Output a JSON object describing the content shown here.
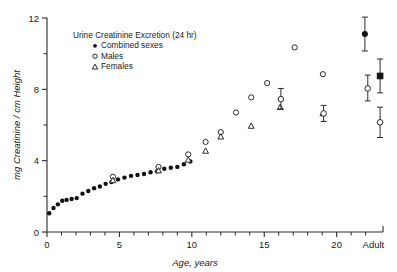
{
  "figure": {
    "legend_title": "Urine  Creatinine  Excretion   (24 hr)",
    "legend_items": [
      {
        "label": "Combined  sexes",
        "marker": "filled-circle"
      },
      {
        "label": "Males",
        "marker": "open-circle"
      },
      {
        "label": "Females",
        "marker": "open-triangle"
      }
    ]
  },
  "chart_data": {
    "type": "scatter",
    "title": "Urine  Creatinine  Excretion   (24 hr)",
    "xlabel": "Age,  years",
    "ylabel": "mg Creatinine / cm Height",
    "xlim": [
      0,
      23.2
    ],
    "ylim": [
      0,
      12
    ],
    "grid": false,
    "legend_position": "top-left-inside",
    "x_ticks_major": [
      0,
      5,
      10,
      15,
      20
    ],
    "x_tick_labels": [
      "0",
      "5",
      "10",
      "15",
      "20",
      "Adult"
    ],
    "x_adult_label": "Adult",
    "x_adult_value": 22.4,
    "y_ticks_major": [
      0,
      4,
      8,
      12
    ],
    "y_tick_labels": [
      "0",
      "4",
      "8",
      "12"
    ],
    "y_ticks_minor": [
      2,
      6,
      10
    ],
    "series": [
      {
        "name": "Combined sexes",
        "marker": "filled-circle",
        "points": [
          {
            "x": 0.15,
            "y": 1.05
          },
          {
            "x": 0.45,
            "y": 1.35
          },
          {
            "x": 0.75,
            "y": 1.55
          },
          {
            "x": 1.05,
            "y": 1.75
          },
          {
            "x": 1.35,
            "y": 1.8
          },
          {
            "x": 1.7,
            "y": 1.85
          },
          {
            "x": 2.05,
            "y": 1.9
          },
          {
            "x": 2.45,
            "y": 2.15
          },
          {
            "x": 2.85,
            "y": 2.3
          },
          {
            "x": 3.25,
            "y": 2.45
          },
          {
            "x": 3.65,
            "y": 2.55
          },
          {
            "x": 4.05,
            "y": 2.7
          },
          {
            "x": 4.45,
            "y": 2.8
          },
          {
            "x": 4.9,
            "y": 2.95
          },
          {
            "x": 5.35,
            "y": 3.05
          },
          {
            "x": 5.8,
            "y": 3.15
          },
          {
            "x": 6.25,
            "y": 3.2
          },
          {
            "x": 6.7,
            "y": 3.25
          },
          {
            "x": 7.15,
            "y": 3.35
          },
          {
            "x": 7.6,
            "y": 3.4
          },
          {
            "x": 8.1,
            "y": 3.55
          },
          {
            "x": 8.55,
            "y": 3.6
          },
          {
            "x": 9.0,
            "y": 3.65
          },
          {
            "x": 9.45,
            "y": 3.8
          },
          {
            "x": 9.9,
            "y": 3.95
          }
        ]
      },
      {
        "name": "Males",
        "marker": "open-circle",
        "points": [
          {
            "x": 4.55,
            "y": 3.1
          },
          {
            "x": 7.7,
            "y": 3.65
          },
          {
            "x": 9.75,
            "y": 4.35
          },
          {
            "x": 10.95,
            "y": 5.05
          },
          {
            "x": 12.0,
            "y": 5.6
          },
          {
            "x": 13.05,
            "y": 6.7
          },
          {
            "x": 14.1,
            "y": 7.55
          },
          {
            "x": 15.2,
            "y": 8.35
          },
          {
            "x": 17.1,
            "y": 10.35
          },
          {
            "x": 19.05,
            "y": 8.85
          }
        ]
      },
      {
        "name": "Females",
        "marker": "open-triangle",
        "points": [
          {
            "x": 4.55,
            "y": 2.9
          },
          {
            "x": 7.7,
            "y": 3.45
          },
          {
            "x": 9.75,
            "y": 4.05
          },
          {
            "x": 10.95,
            "y": 4.55
          },
          {
            "x": 12.0,
            "y": 5.35
          },
          {
            "x": 14.1,
            "y": 5.95
          },
          {
            "x": 16.1,
            "y": 7.0
          },
          {
            "x": 19.05,
            "y": 6.65
          }
        ]
      },
      {
        "name": "Males with error bars",
        "marker": "open-circle-errorbar",
        "points": [
          {
            "x": 16.15,
            "y": 7.45,
            "err_low": 0.55,
            "err_high": 0.6
          },
          {
            "x": 19.1,
            "y": 6.65,
            "err_low": 0.45,
            "err_high": 0.45
          },
          {
            "x": 22.15,
            "y": 8.05,
            "err_low": 0.7,
            "err_high": 0.75
          },
          {
            "x": 23.0,
            "y": 6.15,
            "err_low": 0.85,
            "err_high": 0.85
          }
        ]
      },
      {
        "name": "Combined sexes adult",
        "marker": "filled-circle-errorbar",
        "points": [
          {
            "x": 21.95,
            "y": 11.1,
            "err_low": 0.95,
            "err_high": 0.95
          }
        ]
      },
      {
        "name": "Combined sexes adult square",
        "marker": "filled-square-errorbar",
        "points": [
          {
            "x": 23.0,
            "y": 8.75,
            "err_low": 0.95,
            "err_high": 0.95
          }
        ]
      }
    ]
  }
}
